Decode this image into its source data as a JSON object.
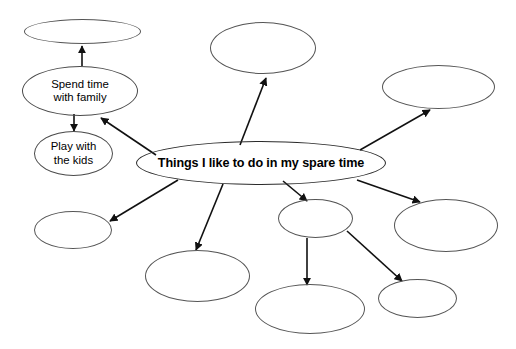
{
  "diagram": {
    "type": "concept-map",
    "title_node": "Things I like to do in my spare time",
    "background_color": "#ffffff",
    "stroke_color": "#4a4a4a",
    "nodes": [
      {
        "id": "central",
        "label": "Things I like to do in my spare time",
        "name": "central-node",
        "x": 136,
        "y": 141,
        "w": 250,
        "h": 44,
        "kind": "central"
      },
      {
        "id": "spend-time-with-family",
        "label": "Spend time\nwith family",
        "line1": "Spend time",
        "line2": "with family",
        "name": "node-spend-time-with-family",
        "x": 22,
        "y": 66,
        "w": 116,
        "h": 50,
        "kind": "labeled"
      },
      {
        "id": "play-with-the-kids",
        "label": "Play with\nthe kids",
        "line1": "Play with",
        "line2": "the kids",
        "name": "node-play-with-the-kids",
        "x": 34,
        "y": 131,
        "w": 79,
        "h": 45,
        "kind": "labeled"
      },
      {
        "id": "empty-top-left",
        "label": "",
        "name": "node-empty-top-left",
        "x": 24,
        "y": 19,
        "w": 117,
        "h": 25,
        "kind": "empty"
      },
      {
        "id": "empty-top-center",
        "label": "",
        "name": "node-empty-top-center",
        "x": 210,
        "y": 22,
        "w": 106,
        "h": 52,
        "kind": "empty"
      },
      {
        "id": "empty-top-right",
        "label": "",
        "name": "node-empty-top-right",
        "x": 382,
        "y": 65,
        "w": 113,
        "h": 44,
        "kind": "empty"
      },
      {
        "id": "empty-left-lower",
        "label": "",
        "name": "node-empty-left-lower",
        "x": 34,
        "y": 211,
        "w": 78,
        "h": 38,
        "kind": "empty"
      },
      {
        "id": "empty-bottom-left",
        "label": "",
        "name": "node-empty-bottom-left",
        "x": 145,
        "y": 250,
        "w": 105,
        "h": 52,
        "kind": "empty"
      },
      {
        "id": "empty-middle-lower",
        "label": "",
        "name": "node-empty-middle-lower",
        "x": 278,
        "y": 199,
        "w": 75,
        "h": 39,
        "kind": "empty"
      },
      {
        "id": "empty-bottom-center",
        "label": "",
        "name": "node-empty-bottom-center",
        "x": 255,
        "y": 284,
        "w": 110,
        "h": 50,
        "kind": "empty"
      },
      {
        "id": "empty-right-lower",
        "label": "",
        "name": "node-empty-right-lower",
        "x": 394,
        "y": 199,
        "w": 104,
        "h": 53,
        "kind": "empty"
      },
      {
        "id": "empty-bottom-right",
        "label": "",
        "name": "node-empty-bottom-right",
        "x": 378,
        "y": 279,
        "w": 79,
        "h": 39,
        "kind": "empty"
      }
    ],
    "edges": [
      {
        "from": "central",
        "to": "spend-time-with-family",
        "name": "edge-central-to-spend-time"
      },
      {
        "from": "central",
        "to": "empty-top-center",
        "name": "edge-central-to-top-center"
      },
      {
        "from": "central",
        "to": "empty-top-right",
        "name": "edge-central-to-top-right"
      },
      {
        "from": "central",
        "to": "empty-left-lower",
        "name": "edge-central-to-left-lower"
      },
      {
        "from": "central",
        "to": "empty-bottom-left",
        "name": "edge-central-to-bottom-left"
      },
      {
        "from": "central",
        "to": "empty-middle-lower",
        "name": "edge-central-to-middle-lower"
      },
      {
        "from": "central",
        "to": "empty-right-lower",
        "name": "edge-central-to-right-lower"
      },
      {
        "from": "spend-time-with-family",
        "to": "empty-top-left",
        "name": "edge-spend-time-to-top-left"
      },
      {
        "from": "spend-time-with-family",
        "to": "play-with-the-kids",
        "name": "edge-spend-time-to-play-with-kids"
      },
      {
        "from": "empty-middle-lower",
        "to": "empty-bottom-center",
        "name": "edge-middle-lower-to-bottom-center"
      },
      {
        "from": "empty-middle-lower",
        "to": "empty-bottom-right",
        "name": "edge-middle-lower-to-bottom-right"
      }
    ]
  }
}
